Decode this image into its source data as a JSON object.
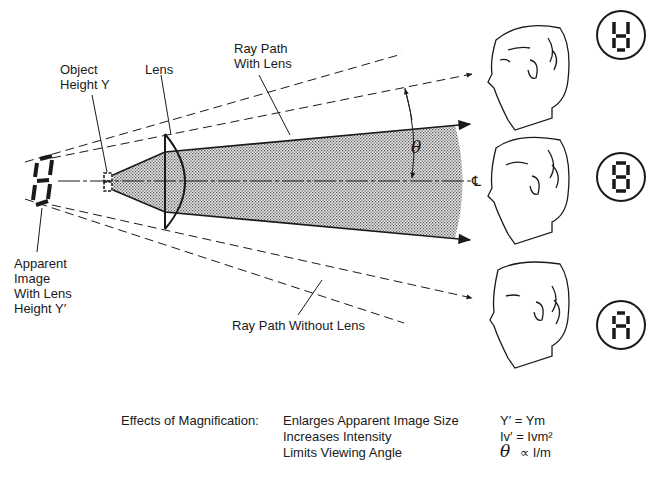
{
  "labels": {
    "object_height": [
      "Object",
      "Height Y"
    ],
    "lens": "Lens",
    "ray_path_with_lens": [
      "Ray Path",
      "With Lens"
    ],
    "apparent_image": [
      "Apparent",
      "Image",
      "With Lens",
      "Height Y′"
    ],
    "ray_path_without_lens": "Ray Path Without Lens",
    "angle_symbol": "θ",
    "centerline_symbol": "℄"
  },
  "observers": [
    {
      "position": "top",
      "display_view": "segments-top-view"
    },
    {
      "position": "center",
      "display_view": "full-8"
    },
    {
      "position": "bottom",
      "display_view": "segments-bottom-view"
    }
  ],
  "caption": {
    "heading": "Effects of Magnification:",
    "rows": [
      {
        "effect": "Enlarges Apparent Image Size",
        "formula": "Y′ = Ym"
      },
      {
        "effect": "Increases Intensity",
        "formula": "Iv′ = Ivm²"
      },
      {
        "effect": "Limits Viewing Angle",
        "formula_symbol": "θ",
        "formula_rest": "∝  I/m"
      }
    ]
  },
  "colors": {
    "ink": "#1a1a1a",
    "shade": "#bdbdbd",
    "background": "#ffffff"
  }
}
